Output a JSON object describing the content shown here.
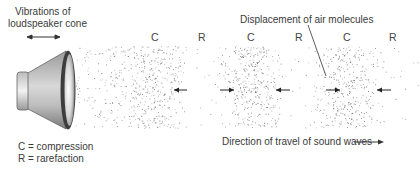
{
  "title_labels": {
    "vibrations_line1": "Vibrations of",
    "vibrations_line2": "loudspeaker cone",
    "displacement": "Displacement of air molecules",
    "direction": "Direction of travel of sound waves"
  },
  "legend": {
    "compression": "C = compression",
    "rarefaction": "R = rarefaction"
  },
  "zones": [
    {
      "letter": "C",
      "x": 155
    },
    {
      "letter": "R",
      "x": 202
    },
    {
      "letter": "C",
      "x": 251
    },
    {
      "letter": "R",
      "x": 299
    },
    {
      "letter": "C",
      "x": 347
    },
    {
      "letter": "R",
      "x": 393
    }
  ],
  "molecule_arrows": [
    {
      "direction": "left",
      "x1": 187,
      "x2": 174
    },
    {
      "direction": "right",
      "x1": 220,
      "x2": 234
    },
    {
      "direction": "left",
      "x1": 290,
      "x2": 276
    },
    {
      "direction": "right",
      "x1": 326,
      "x2": 340
    },
    {
      "direction": "left",
      "x1": 391,
      "x2": 377
    }
  ],
  "colors": {
    "stipple": "#555555",
    "text": "#3a3a3a",
    "speaker_dark": "#444444",
    "speaker_light": "#e8e8e8"
  }
}
